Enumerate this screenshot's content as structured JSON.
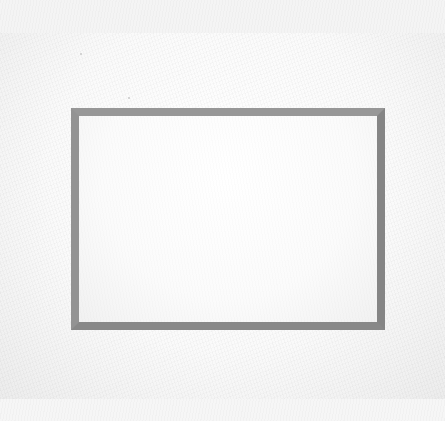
{
  "scene": {
    "subject": "blank picture mat (passe-partout)",
    "colors": {
      "background_strip": "#f4f4f4",
      "mat_board": "#fafafa",
      "bevel_frame": "#8e8e8e",
      "window_interior": "#fbfbfb"
    },
    "frame_geometry": {
      "outer": {
        "x": 71,
        "y": 108,
        "w": 314,
        "h": 222
      },
      "bevel_width": 8,
      "window": {
        "x": 79,
        "y": 116,
        "w": 298,
        "h": 206
      }
    },
    "text": []
  }
}
